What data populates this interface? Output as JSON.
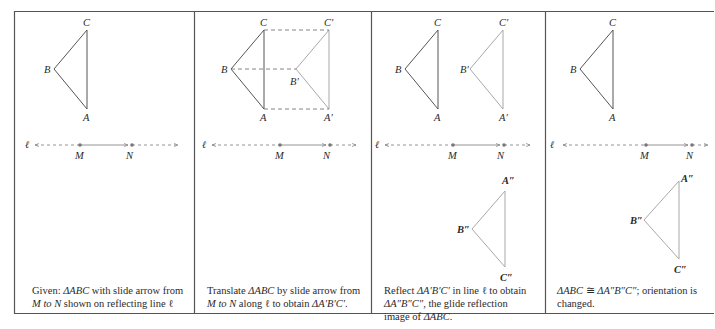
{
  "figure": {
    "panels": [
      {
        "id": "panel-1",
        "caption_line1_pre": "Given: ",
        "caption_line1_tri": "ΔABC",
        "caption_line1_post": " with slide arrow from",
        "caption_line2_m": "M",
        "caption_line2_to": " to ",
        "caption_line2_n": "N",
        "caption_line2_post": " shown on reflecting line ℓ",
        "labels": {
          "A": "A",
          "B": "B",
          "C": "C",
          "M": "M",
          "N": "N",
          "line": "ℓ"
        }
      },
      {
        "id": "panel-2",
        "caption_line1_pre": "Translate ",
        "caption_line1_tri": "ΔABC",
        "caption_line1_post": " by slide arrow from",
        "caption_line2_m": "M",
        "caption_line2_to": " to ",
        "caption_line2_n": "N",
        "caption_line2_post": " along ℓ to obtain ",
        "caption_line2_tri": "ΔA′B′C′",
        "caption_line2_end": ".",
        "labels": {
          "A": "A",
          "B": "B",
          "C": "C",
          "A1": "A′",
          "B1": "B′",
          "C1": "C′",
          "M": "M",
          "N": "N",
          "line": "ℓ"
        }
      },
      {
        "id": "panel-3",
        "caption_line1_pre": "Reflect ",
        "caption_line1_tri": "ΔA′B′C′",
        "caption_line1_post": " in line ℓ to obtain",
        "caption_line2_tri": "ΔA″B″C″",
        "caption_line2_post": ", the glide reflection",
        "caption_line3_pre": "image of ",
        "caption_line3_tri": "ΔABC",
        "caption_line3_post": ".",
        "labels": {
          "A": "A",
          "B": "B",
          "C": "C",
          "A1": "A′",
          "B1": "B′",
          "C1": "C′",
          "A2": "A″",
          "B2": "B″",
          "C2": "C″",
          "M": "M",
          "N": "N",
          "line": "ℓ"
        }
      },
      {
        "id": "panel-4",
        "caption_line1_tri1": "ΔABC",
        "caption_line1_cong": " ≅ ",
        "caption_line1_tri2": "ΔA″B″C″",
        "caption_line1_post": "; orientation is",
        "caption_line2": "changed.",
        "labels": {
          "A": "A",
          "B": "B",
          "C": "C",
          "A2": "A″",
          "B2": "B″",
          "C2": "C″",
          "M": "M",
          "N": "N",
          "line": "ℓ"
        }
      }
    ]
  },
  "colors": {
    "border": "#555555",
    "original_triangle": "#555555",
    "image_triangle": "#a8a8a8",
    "dashed": "#777777",
    "text": "#2a2a2a"
  }
}
